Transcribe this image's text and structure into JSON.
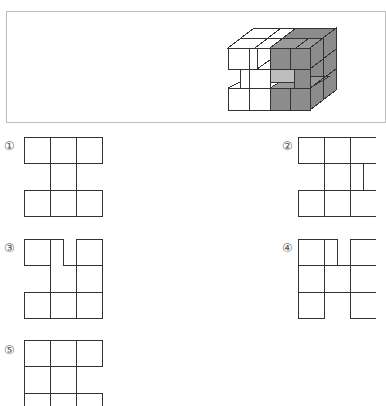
{
  "problem": {
    "figure": {
      "description": "3D stack of unit cubes, 3x3x3 with some cubes removed; right and front-right faces shaded gray",
      "shade_color": "#8c8c8c",
      "line_color": "#333333"
    },
    "options": [
      {
        "number": "①",
        "id": 1
      },
      {
        "number": "②",
        "id": 2
      },
      {
        "number": "③",
        "id": 3
      },
      {
        "number": "④",
        "id": 4
      },
      {
        "number": "⑤",
        "id": 5
      }
    ]
  }
}
